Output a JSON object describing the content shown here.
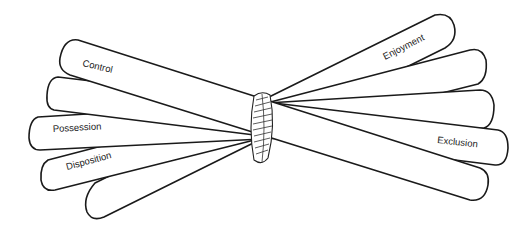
{
  "diagram": {
    "title": "",
    "center_tie": {
      "icon": "rope-knot-icon"
    },
    "sticks": [
      {
        "id": "control",
        "label": "Control"
      },
      {
        "id": "unlabeled-left",
        "label": ""
      },
      {
        "id": "possession",
        "label": "Possession"
      },
      {
        "id": "disposition",
        "label": "Disposition"
      },
      {
        "id": "unlabeled-bottom-left",
        "label": ""
      },
      {
        "id": "enjoyment",
        "label": "Enjoyment"
      },
      {
        "id": "exclusion",
        "label": "Exclusion"
      }
    ],
    "colors": {
      "stroke": "#1a1a1a",
      "fill": "#ffffff",
      "text": "#222222"
    }
  }
}
